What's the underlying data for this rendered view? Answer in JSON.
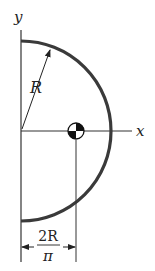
{
  "diagram": {
    "labels": {
      "y_axis": "y",
      "x_axis": "x",
      "radius": "R",
      "dimension_numerator": "2R",
      "dimension_denominator": "π"
    },
    "colors": {
      "arc": "#3a3a3a",
      "lines": "#333333",
      "text": "#222222",
      "centroid_dark": "#111111",
      "centroid_light": "#ffffff"
    }
  }
}
